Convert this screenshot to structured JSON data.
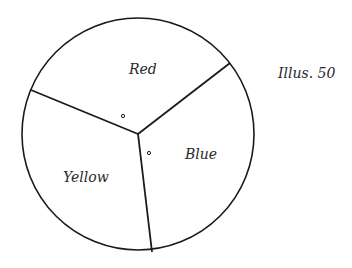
{
  "caption": "Illus. 50",
  "spinner": {
    "center": [
      138,
      134
    ],
    "radius": 116,
    "stroke_color": "#1a1a1a",
    "sections": [
      {
        "label": "Red",
        "label_pos": [
          143,
          74
        ]
      },
      {
        "label": "Blue",
        "label_pos": [
          201,
          159
        ]
      },
      {
        "label": "Yellow",
        "label_pos": [
          84,
          182
        ]
      }
    ],
    "divider_endpoints": [
      [
        230,
        63
      ],
      [
        31,
        90
      ],
      [
        152,
        252
      ]
    ],
    "markers": [
      [
        123,
        116
      ],
      [
        149,
        153
      ]
    ]
  }
}
